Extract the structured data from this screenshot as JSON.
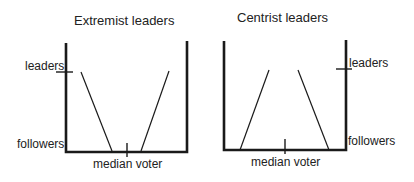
{
  "panels": [
    {
      "id": "extremist",
      "title": "Extremist leaders",
      "labels": {
        "leaders": "leaders",
        "followers": "followers",
        "median": "median voter"
      }
    },
    {
      "id": "centrist",
      "title": "Centrist leaders",
      "labels": {
        "leaders": "leaders",
        "followers": "followers",
        "median": "median voter"
      }
    }
  ],
  "colors": {
    "line": "#1a1a1a",
    "text": "#222222"
  }
}
